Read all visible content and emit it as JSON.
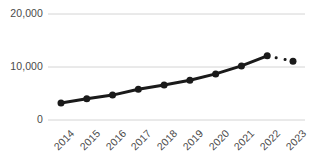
{
  "chart_data": {
    "type": "line",
    "title": "",
    "subtitle": "",
    "xlabel": "",
    "ylabel": "",
    "categories": [
      "2014",
      "2015",
      "2016",
      "2017",
      "2018",
      "2019",
      "2020",
      "2021",
      "2022",
      "2023"
    ],
    "values": [
      3200,
      4000,
      4700,
      5800,
      6600,
      7500,
      8700,
      10200,
      12100,
      11100
    ],
    "series": [
      {
        "name": "",
        "values": [
          3200,
          4000,
          4700,
          5800,
          6600,
          7500,
          8700,
          10200,
          12100,
          11100
        ]
      }
    ],
    "ylim": [
      0,
      20000
    ],
    "yticks": [
      0,
      10000,
      20000
    ],
    "ytick_labels": [
      "0",
      "10,000",
      "20,000"
    ],
    "xtick_labels": [
      "2014",
      "2015",
      "2016",
      "2017",
      "2018",
      "2019",
      "2020",
      "2021",
      "2022",
      "2023"
    ],
    "grid": true,
    "grid_axis": "y",
    "legend": false,
    "legend_position": "none",
    "xtick_rotation": -45,
    "annotations": [],
    "line_style_segments": [
      {
        "from": "2014",
        "to": "2022",
        "style": "solid"
      },
      {
        "from": "2022",
        "to": "2023",
        "style": "dotted"
      }
    ],
    "colors": {
      "line": "#1a1a1a",
      "marker": "#1a1a1a",
      "grid": "#d4d4d4",
      "tick_label": "#4a4a4a",
      "background": "#ffffff"
    },
    "marker": "circle",
    "marker_size": 7,
    "line_width": 3
  }
}
